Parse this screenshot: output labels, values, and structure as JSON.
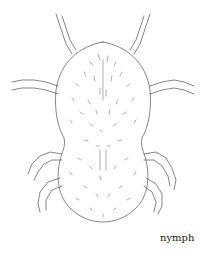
{
  "figure": {
    "caption": "nymph",
    "line_color": "#555555"
  }
}
